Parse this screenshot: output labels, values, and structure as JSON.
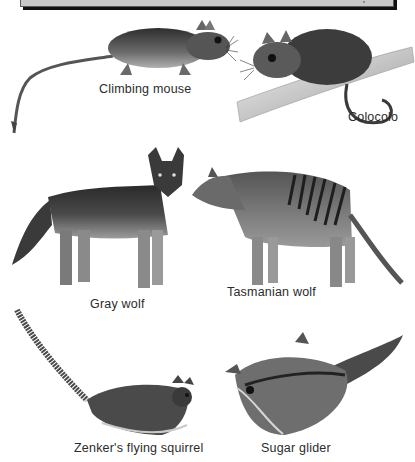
{
  "header": {
    "title": ""
  },
  "animals": [
    {
      "id": "climbing-mouse",
      "label": "Climbing mouse"
    },
    {
      "id": "colocolo",
      "label": "Colocolo"
    },
    {
      "id": "gray-wolf",
      "label": "Gray wolf"
    },
    {
      "id": "tasmanian-wolf",
      "label": "Tasmanian wolf"
    },
    {
      "id": "zenkers-flying-squirrel",
      "label": "Zenker's flying squirrel"
    },
    {
      "id": "sugar-glider",
      "label": "Sugar glider"
    }
  ],
  "colors": {
    "header_fill": "#c9c9c9",
    "header_shadow": "#111111",
    "ink": "#2b2b2b",
    "fur_dark": "#3a3a3a",
    "fur_mid": "#777777",
    "fur_light": "#b5b5b5"
  }
}
